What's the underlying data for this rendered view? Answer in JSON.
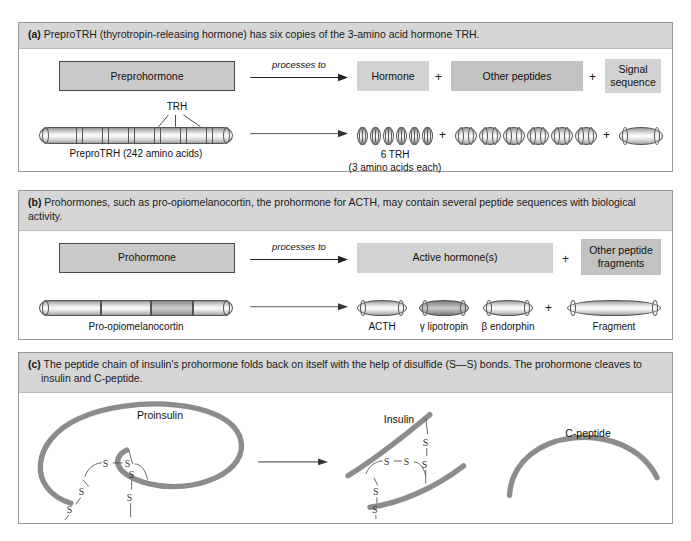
{
  "panels": {
    "a": {
      "tag": "(a)",
      "header": "PreproTRH (thyrotropin-releasing hormone) has six copies of the 3-amino acid hormone TRH.",
      "generic": {
        "source_box": "Preprohormone",
        "arrow_label": "processes to",
        "product_1": "Hormone",
        "plus_1": "+",
        "product_2": "Other peptides",
        "plus_2": "+",
        "product_3": "Signal sequence"
      },
      "specific": {
        "source_label": "PreproTRH (242 amino acids)",
        "callout": "TRH",
        "plus_1": "+",
        "plus_2": "+",
        "product_1_caption_line1": "6 TRH",
        "product_1_caption_line2": "(3 amino acids each)",
        "trh_copies": 6,
        "other_peptides_count": 6
      }
    },
    "b": {
      "tag": "(b)",
      "header": "Prohormones, such as pro-opiomelanocortin, the prohormone for ACTH, may contain several peptide sequences with biological activity.",
      "generic": {
        "source_box": "Prohormone",
        "arrow_label": "processes to",
        "product_1": "Active hormone(s)",
        "plus_1": "+",
        "product_2": "Other peptide fragments"
      },
      "specific": {
        "source_label": "Pro-opiomelanocortin",
        "products": [
          {
            "label": "ACTH",
            "shade": "light"
          },
          {
            "label": "γ lipotropin",
            "shade": "dark"
          },
          {
            "label": "β endorphin",
            "shade": "light"
          },
          {
            "label": "Fragment",
            "shade": "light"
          }
        ],
        "plus_1": "+"
      }
    },
    "c": {
      "tag": "(c)",
      "header_line1": "The peptide chain of insulin's prohormone folds back on itself with the help of disulfide (S—S) bonds. The prohormone cleaves to",
      "header_line2": "insulin and C-peptide.",
      "labels": {
        "proinsulin": "Proinsulin",
        "insulin": "Insulin",
        "c_peptide": "C-peptide"
      },
      "bond_symbol": "S",
      "bond_pair": "S—S"
    }
  },
  "colors": {
    "panel_header_bg": "#d6d6d6",
    "panel_border": "#9a9a9a",
    "box_outline_fill": "#c9c9c9",
    "box_outline_stroke": "#4a4a4a",
    "box_light_fill": "#d2d2d2",
    "box_dark_fill": "#c2c2c2",
    "chain_gray": "#8c8c8c",
    "text": "#111111"
  }
}
